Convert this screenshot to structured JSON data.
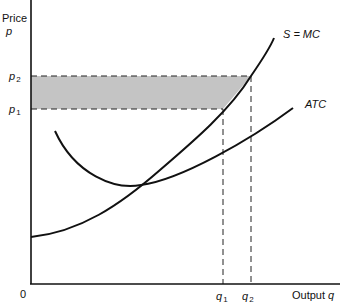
{
  "figure": {
    "y_axis": {
      "label": "Price",
      "symbol": "p"
    },
    "x_axis": {
      "label": "Output",
      "symbol": "q"
    },
    "origin_label": "0",
    "price_levels": [
      {
        "base": "p",
        "sub": "2"
      },
      {
        "base": "p",
        "sub": "1"
      }
    ],
    "output_levels": [
      {
        "base": "q",
        "sub": "1"
      },
      {
        "base": "q",
        "sub": "2"
      }
    ],
    "curves": [
      {
        "name": "S = MC"
      },
      {
        "name": "ATC"
      }
    ],
    "shaded_area_color": "#c4c4c4",
    "line_color": "#111111"
  }
}
